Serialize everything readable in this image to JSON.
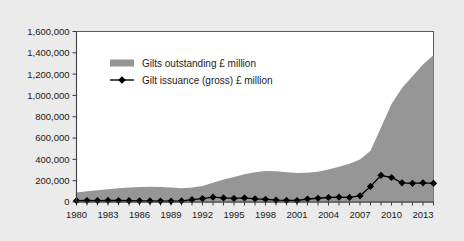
{
  "figure": {
    "background_color": "#ebebeb",
    "plot_background_color": "#ffffff",
    "frame_color": "#5a5a5a"
  },
  "chart_data": {
    "type": "area",
    "title": "",
    "subtitle": "",
    "xlabel": "",
    "ylabel": "",
    "xlim": [
      1980,
      2014
    ],
    "ylim": [
      0,
      1600000
    ],
    "grid": false,
    "legend_position": "inside-top-left",
    "x": [
      1980,
      1981,
      1982,
      1983,
      1984,
      1985,
      1986,
      1987,
      1988,
      1989,
      1990,
      1991,
      1992,
      1993,
      1994,
      1995,
      1996,
      1997,
      1998,
      1999,
      2000,
      2001,
      2002,
      2003,
      2004,
      2005,
      2006,
      2007,
      2008,
      2009,
      2010,
      2011,
      2012,
      2013,
      2014
    ],
    "xticks": [
      1980,
      1983,
      1986,
      1989,
      1992,
      1995,
      1998,
      2001,
      2004,
      2007,
      2010,
      2013
    ],
    "xticklabels": [
      "1980",
      "1983",
      "1986",
      "1989",
      "1992",
      "1995",
      "1998",
      "2001",
      "2004",
      "2007",
      "2010",
      "2013"
    ],
    "yticks": [
      0,
      200000,
      400000,
      600000,
      800000,
      1000000,
      1200000,
      1400000,
      1600000
    ],
    "yticklabels": [
      "0",
      "200,000",
      "400,000",
      "600,000",
      "800,000",
      "1,000,000",
      "1,200,000",
      "1,400,000",
      "1,600,000"
    ],
    "series": [
      {
        "name": "Gilts outstanding £ million",
        "chart_type": "area",
        "color": "#969696",
        "values": [
          90000,
          100000,
          110000,
          120000,
          128000,
          135000,
          140000,
          143000,
          140000,
          135000,
          130000,
          135000,
          150000,
          180000,
          210000,
          235000,
          260000,
          280000,
          290000,
          288000,
          280000,
          272000,
          275000,
          285000,
          305000,
          330000,
          360000,
          400000,
          480000,
          700000,
          920000,
          1070000,
          1180000,
          1290000,
          1380000
        ]
      },
      {
        "name": "Gilt issuance (gross) £ million",
        "chart_type": "line",
        "color": "#000000",
        "marker": "diamond",
        "values": [
          12000,
          14000,
          13000,
          15000,
          14000,
          12000,
          11000,
          10000,
          9000,
          8000,
          10000,
          22000,
          32000,
          45000,
          38000,
          34000,
          38000,
          30000,
          26000,
          18000,
          15000,
          14000,
          28000,
          35000,
          42000,
          45000,
          43000,
          58000,
          146000,
          250000,
          230000,
          180000,
          175000,
          180000,
          175000
        ]
      }
    ]
  },
  "legend": {
    "items": [
      {
        "label": "Gilts outstanding £ million",
        "swatch": "gray-bar-swatch",
        "color": "#969696"
      },
      {
        "label": "Gilt issuance (gross) £ million",
        "swatch": "black-diamond-line-swatch",
        "color": "#000000"
      }
    ]
  }
}
